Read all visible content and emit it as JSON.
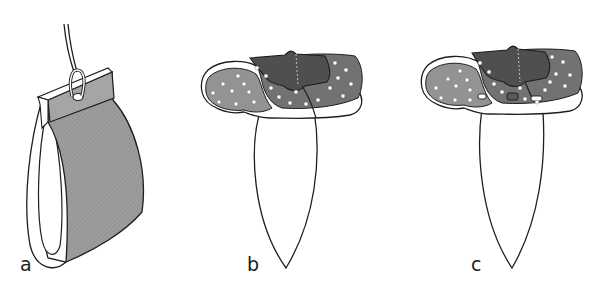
{
  "figure": {
    "panels": [
      {
        "id": "a",
        "label": "a",
        "description": "Gray sheet folded over a loop, hung by a cord through an eyelet"
      },
      {
        "id": "b",
        "label": "b",
        "description": "Perforated pad with dark flap, long loop hanging below"
      },
      {
        "id": "c",
        "label": "c",
        "description": "Perforated pad with dark flap and fastening tabs, long loop hanging below"
      }
    ]
  },
  "colors": {
    "background": "#ffffff",
    "outline": "#1e1e1e",
    "sheet_gray": "#9b9b9b",
    "pad_light": "#8f8f8f",
    "pad_dark": "#6e6e6e",
    "flap_dark": "#4e4e4e",
    "dot": "#ffffff"
  }
}
